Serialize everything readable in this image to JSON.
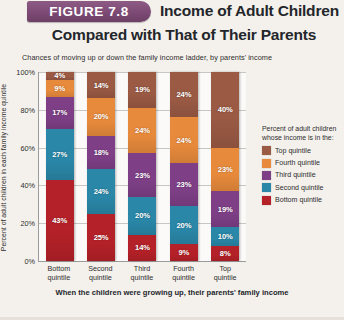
{
  "header": {
    "figure_badge": "FIGURE 7.8",
    "title_line1": "Income of Adult Children",
    "title_line2": "Compared with That of Their Parents",
    "badge_color": "#7c4a74"
  },
  "chart_data": {
    "type": "bar",
    "stacked": true,
    "title": "Income of Adult Children Compared with That of Their Parents",
    "subtitle": "Chances of moving up or down the family income ladder, by parents' income",
    "xlabel": "When the children were growing up, their parents' family income",
    "ylabel": "Percent of adult children in each family income quintile",
    "ylim": [
      0,
      100
    ],
    "yticks": [
      "0%",
      "20%",
      "40%",
      "60%",
      "80%",
      "100%"
    ],
    "grid": true,
    "legend_position": "right",
    "legend_title": "Percent of adult children whose income is in the:",
    "categories": [
      "Bottom quintile",
      "Second quintile",
      "Third quintile",
      "Fourth quintile",
      "Top quintile"
    ],
    "category_lines": [
      [
        "Bottom",
        "quintile"
      ],
      [
        "Second",
        "quintile"
      ],
      [
        "Third",
        "quintile"
      ],
      [
        "Fourth",
        "quintile"
      ],
      [
        "Top",
        "quintile"
      ]
    ],
    "series": [
      {
        "name": "Top quintile",
        "color": "#9a5a44",
        "values": [
          4,
          14,
          19,
          24,
          40
        ]
      },
      {
        "name": "Fourth quintile",
        "color": "#e78a3c",
        "values": [
          9,
          20,
          24,
          24,
          23
        ]
      },
      {
        "name": "Third quintile",
        "color": "#7e3f86",
        "values": [
          17,
          18,
          23,
          23,
          19
        ]
      },
      {
        "name": "Second quintile",
        "color": "#2a87a8",
        "values": [
          27,
          24,
          20,
          20,
          10
        ]
      },
      {
        "name": "Bottom quintile",
        "color": "#b52128",
        "values": [
          43,
          25,
          14,
          9,
          8
        ]
      }
    ],
    "value_labels": {
      "Bottom quintile": [
        "4%",
        "9%",
        "17%",
        "27%",
        "43%"
      ],
      "Second quintile": [
        "14%",
        "20%",
        "18%",
        "24%",
        "25%"
      ],
      "Third quintile": [
        "19%",
        "24%",
        "23%",
        "20%",
        "14%"
      ],
      "Fourth quintile": [
        "24%",
        "24%",
        "23%",
        "20%",
        "9%"
      ],
      "Top quintile": [
        "40%",
        "23%",
        "19%",
        "10%",
        "8%"
      ]
    }
  }
}
